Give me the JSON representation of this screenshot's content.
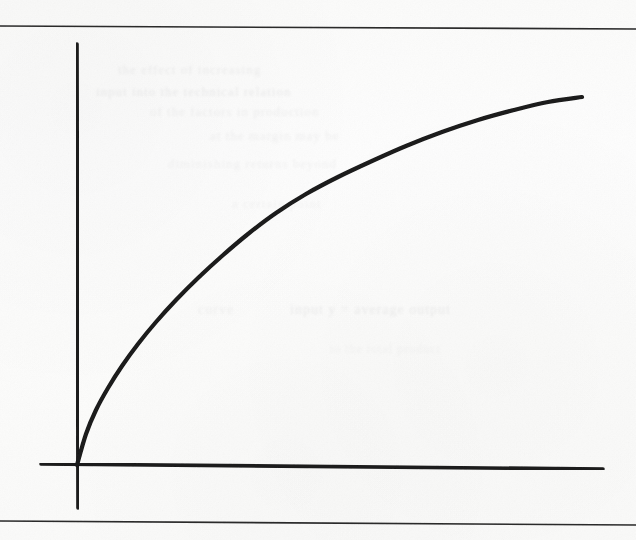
{
  "page": {
    "width": 636,
    "height": 540,
    "paper_color": "#fdfdfc",
    "ink_color": "#1a1a1a",
    "rule_color": "#2a2a2a",
    "ghost_color": "#b9b9bb"
  },
  "rules": {
    "top": {
      "name": "top-rule",
      "x1": 0,
      "y1": 26,
      "x2": 636,
      "y2": 29,
      "width": 1.6
    },
    "bottom": {
      "name": "bottom-rule",
      "x1": 0,
      "y1": 521,
      "x2": 636,
      "y2": 525,
      "width": 1.6
    }
  },
  "ghost_text": [
    {
      "text": "the  effect  of  increasing",
      "x": 118,
      "y": 62,
      "size": 13,
      "opacity": 0.22
    },
    {
      "text": "input  into  the  technical  relation",
      "x": 96,
      "y": 84,
      "size": 13,
      "opacity": 0.26
    },
    {
      "text": "of  the  factors  in  production",
      "x": 150,
      "y": 104,
      "size": 13,
      "opacity": 0.2
    },
    {
      "text": "at  the  margin  may  be",
      "x": 210,
      "y": 128,
      "size": 13,
      "opacity": 0.18
    },
    {
      "text": "diminishing  returns  beyond",
      "x": 168,
      "y": 156,
      "size": 13,
      "opacity": 0.16
    },
    {
      "text": "a  certain  point",
      "x": 232,
      "y": 196,
      "size": 13,
      "opacity": 0.15
    },
    {
      "text": "input  y  =  average  output",
      "x": 290,
      "y": 302,
      "size": 14,
      "opacity": 0.24
    },
    {
      "text": "curve",
      "x": 198,
      "y": 302,
      "size": 14,
      "opacity": 0.18
    },
    {
      "text": "to  the  total  product",
      "x": 330,
      "y": 342,
      "size": 12,
      "opacity": 0.12
    }
  ],
  "chart_data": {
    "type": "line",
    "title": "",
    "subtitle": "",
    "xlabel": "",
    "ylabel": "",
    "legend": [],
    "grid": false,
    "axis_style": "hand-drawn two-axis (L-shaped) with stub extensions past origin",
    "origin": {
      "x": 77,
      "y": 465
    },
    "x_axis": {
      "name": "x-axis",
      "x1": 41,
      "y1": 464,
      "x2": 603,
      "y2": 469,
      "width": 3.6
    },
    "y_axis": {
      "name": "y-axis",
      "x1": 77,
      "y1": 44,
      "x2": 78,
      "y2": 508,
      "width": 3.6
    },
    "xlim": [
      0,
      1
    ],
    "ylim": [
      0,
      1
    ],
    "series": [
      {
        "name": "diminishing-returns-curve",
        "color": "#1a1a1a",
        "stroke_width": 4.2,
        "shape": "concave-down saturating (logarithmic / exponential-approach)",
        "points_px": [
          [
            77,
            465
          ],
          [
            86,
            434
          ],
          [
            96,
            410
          ],
          [
            108,
            388
          ],
          [
            122,
            366
          ],
          [
            138,
            344
          ],
          [
            156,
            322
          ],
          [
            176,
            300
          ],
          [
            198,
            278
          ],
          [
            222,
            256
          ],
          [
            248,
            234
          ],
          [
            276,
            213
          ],
          [
            306,
            194
          ],
          [
            338,
            177
          ],
          [
            372,
            161
          ],
          [
            406,
            146
          ],
          [
            442,
            132
          ],
          [
            478,
            120
          ],
          [
            514,
            110
          ],
          [
            548,
            102
          ],
          [
            582,
            97
          ]
        ],
        "x_values": [
          0.0,
          0.02,
          0.04,
          0.06,
          0.09,
          0.12,
          0.15,
          0.19,
          0.23,
          0.28,
          0.34,
          0.39,
          0.45,
          0.52,
          0.58,
          0.65,
          0.72,
          0.79,
          0.86,
          0.93,
          1.0
        ],
        "y_values": [
          0.0,
          0.07,
          0.13,
          0.18,
          0.24,
          0.29,
          0.34,
          0.39,
          0.44,
          0.5,
          0.55,
          0.6,
          0.64,
          0.68,
          0.72,
          0.76,
          0.79,
          0.82,
          0.84,
          0.86,
          0.87
        ]
      }
    ],
    "annotations": []
  }
}
